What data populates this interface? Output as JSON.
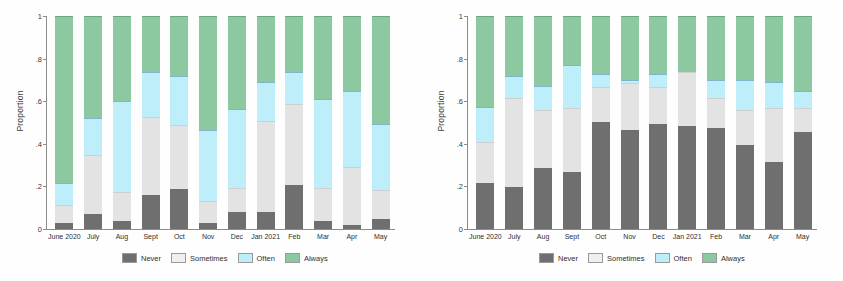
{
  "figure": {
    "background": "#ffffff",
    "panels": [
      "left",
      "right"
    ]
  },
  "colors": {
    "never": "#6f6f6f",
    "sometimes": "#e3e3e3",
    "often": "#bdeefa",
    "always": "#8cc9a0",
    "axis": "#8c8c8c",
    "text": "#2f2f2f"
  },
  "legend": {
    "position": "bottom-center",
    "entries": [
      {
        "label": "Never",
        "color": "#6f6f6f",
        "key": "never"
      },
      {
        "label": "Sometimes",
        "color": "#e3e3e3",
        "key": "sometimes"
      },
      {
        "label": "Often",
        "color": "#bdeefa",
        "key": "often"
      },
      {
        "label": "Always",
        "color": "#8cc9a0",
        "key": "always"
      }
    ]
  },
  "axis": {
    "ylabel": "Proportion",
    "yticks": [
      "1",
      ".8",
      ".6",
      ".4",
      ".2",
      "0"
    ],
    "ytick_values": [
      1,
      0.8,
      0.6,
      0.4,
      0.2,
      0
    ],
    "ylim": [
      0,
      1
    ],
    "grid": false
  },
  "chart_data": [
    {
      "type": "bar",
      "panel": "left",
      "stacked": true,
      "normalized": true,
      "title": "",
      "xlabel": "",
      "ylabel": "Proportion",
      "ylim": [
        0,
        1
      ],
      "grid": false,
      "legend_position": "bottom",
      "categories": [
        "June 2020",
        "July",
        "Aug",
        "Sept",
        "Oct",
        "Nov",
        "Dec",
        "Jan 2021",
        "Feb",
        "Mar",
        "Apr",
        "May"
      ],
      "series": [
        {
          "name": "Never",
          "color": "#6f6f6f",
          "values": [
            0.03,
            0.07,
            0.04,
            0.16,
            0.19,
            0.03,
            0.08,
            0.08,
            0.21,
            0.04,
            0.02,
            0.05
          ]
        },
        {
          "name": "Sometimes",
          "color": "#e3e3e3",
          "values": [
            0.08,
            0.28,
            0.13,
            0.37,
            0.3,
            0.1,
            0.11,
            0.43,
            0.38,
            0.15,
            0.27,
            0.13
          ]
        },
        {
          "name": "Often",
          "color": "#bdeefa",
          "values": [
            0.1,
            0.17,
            0.43,
            0.21,
            0.23,
            0.33,
            0.37,
            0.18,
            0.15,
            0.42,
            0.36,
            0.31
          ]
        },
        {
          "name": "Always",
          "color": "#8cc9a0",
          "values": [
            0.79,
            0.48,
            0.4,
            0.26,
            0.28,
            0.54,
            0.44,
            0.31,
            0.26,
            0.39,
            0.35,
            0.51
          ]
        }
      ],
      "cumulative_boundaries": {
        "June 2020": [
          0.03,
          0.11,
          0.21,
          1.0
        ],
        "July": [
          0.07,
          0.35,
          0.52,
          1.0
        ],
        "Aug": [
          0.04,
          0.17,
          0.6,
          1.0
        ],
        "Sept": [
          0.16,
          0.53,
          0.74,
          1.0
        ],
        "Oct": [
          0.19,
          0.49,
          0.72,
          1.0
        ],
        "Nov": [
          0.03,
          0.13,
          0.46,
          1.0
        ],
        "Dec": [
          0.08,
          0.19,
          0.56,
          1.0
        ],
        "Jan 2021": [
          0.08,
          0.51,
          0.69,
          1.0
        ],
        "Feb": [
          0.21,
          0.59,
          0.74,
          1.0
        ],
        "Mar": [
          0.04,
          0.19,
          0.61,
          1.0
        ],
        "Apr": [
          0.02,
          0.29,
          0.65,
          1.0
        ],
        "May": [
          0.05,
          0.18,
          0.49,
          1.0
        ]
      }
    },
    {
      "type": "bar",
      "panel": "right",
      "stacked": true,
      "normalized": true,
      "title": "",
      "xlabel": "",
      "ylabel": "Proportion",
      "ylim": [
        0,
        1
      ],
      "grid": false,
      "legend_position": "bottom",
      "categories": [
        "June 2020",
        "July",
        "Aug",
        "Sept",
        "Oct",
        "Nov",
        "Dec",
        "Jan 2021",
        "Feb",
        "Mar",
        "Apr",
        "May"
      ],
      "series": [
        {
          "name": "Never",
          "color": "#6f6f6f",
          "values": [
            0.22,
            0.2,
            0.29,
            0.27,
            0.51,
            0.47,
            0.5,
            0.49,
            0.48,
            0.4,
            0.32,
            0.46
          ]
        },
        {
          "name": "Sometimes",
          "color": "#e3e3e3",
          "values": [
            0.19,
            0.42,
            0.27,
            0.3,
            0.16,
            0.22,
            0.17,
            0.25,
            0.14,
            0.16,
            0.25,
            0.11
          ]
        },
        {
          "name": "Often",
          "color": "#bdeefa",
          "values": [
            0.16,
            0.1,
            0.11,
            0.2,
            0.06,
            0.01,
            0.06,
            0.0,
            0.08,
            0.14,
            0.12,
            0.08
          ]
        },
        {
          "name": "Always",
          "color": "#8cc9a0",
          "values": [
            0.43,
            0.28,
            0.33,
            0.23,
            0.27,
            0.3,
            0.27,
            0.26,
            0.3,
            0.3,
            0.31,
            0.35
          ]
        }
      ],
      "cumulative_boundaries": {
        "June 2020": [
          0.22,
          0.41,
          0.57,
          1.0
        ],
        "July": [
          0.2,
          0.62,
          0.72,
          1.0
        ],
        "Aug": [
          0.29,
          0.56,
          0.67,
          1.0
        ],
        "Sept": [
          0.27,
          0.57,
          0.76,
          1.0
        ],
        "Oct": [
          0.51,
          0.67,
          0.73,
          1.0
        ],
        "Nov": [
          0.47,
          0.69,
          0.7,
          1.0
        ],
        "Dec": [
          0.5,
          0.67,
          0.73,
          1.0
        ],
        "Jan 2021": [
          0.49,
          0.74,
          0.74,
          1.0
        ],
        "Feb": [
          0.48,
          0.62,
          0.7,
          1.0
        ],
        "Mar": [
          0.4,
          0.56,
          0.7,
          1.0
        ],
        "Apr": [
          0.32,
          0.57,
          0.69,
          1.0
        ],
        "May": [
          0.46,
          0.57,
          0.65,
          1.0
        ]
      }
    }
  ]
}
